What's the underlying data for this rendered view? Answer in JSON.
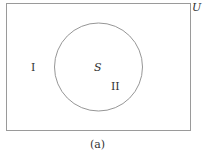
{
  "diagram": {
    "type": "venn",
    "universe_label": "U",
    "set_label": "S",
    "region_outside_label": "I",
    "region_inside_label": "II",
    "caption": "(a)",
    "colors": {
      "stroke": "#9a9a9a",
      "text": "#333333"
    }
  }
}
